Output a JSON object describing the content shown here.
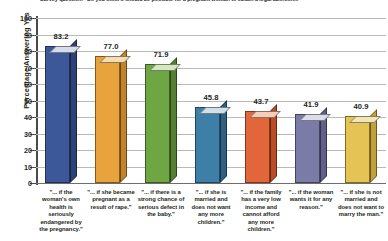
{
  "chart_data": {
    "type": "bar",
    "title": "Survey question: \"Do you think it should be possible for a pregnant woman to obtain a legal abortion...\"",
    "xlabel": "",
    "ylabel": "Percentage Answering Yes",
    "ylim": [
      0,
      100
    ],
    "ytick_step": 10,
    "yticks": [
      "100",
      "90",
      "80",
      "70",
      "60",
      "50",
      "40",
      "30",
      "20",
      "10",
      "0"
    ],
    "grid": true,
    "legend": "none",
    "categories": [
      "\"... if the woman's own health is seriously endangered by the pregnancy.\"",
      "\"... if she became pregnant as a result of rape.\"",
      "\"... if there is a strong chance of serious defect in the baby.\"",
      "\"... if she is married and does not want any more children.\"",
      "\"... if the family has a very low income and cannot afford any more children.\"",
      "\"... if the woman wants it for any reason.\"",
      "\"... if she is not married and does not want to marry the man.\""
    ],
    "values": [
      83.2,
      77.0,
      71.9,
      45.8,
      43.7,
      41.9,
      40.9
    ],
    "value_labels": [
      "83.2",
      "77.0",
      "71.9",
      "45.8",
      "43.7",
      "41.9",
      "40.9"
    ],
    "colors": [
      "#3c5899",
      "#e8a33d",
      "#6ea644",
      "#3e7fa8",
      "#e2663a",
      "#7b7ba8",
      "#e5c354"
    ],
    "colors_top": [
      "#d7dceb",
      "#f6dcae",
      "#d4e8c0",
      "#cfe0ea",
      "#f6cdb8",
      "#dcdcea",
      "#f4e6b4"
    ],
    "colors_side": [
      "#2c4279",
      "#c2832a",
      "#538032",
      "#2d6083",
      "#bb4c26",
      "#60608a",
      "#c2a13c"
    ]
  }
}
